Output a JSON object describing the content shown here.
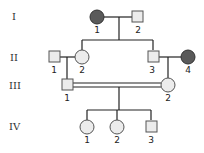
{
  "generations": [
    {
      "label": "I",
      "members": [
        {
          "id": "1",
          "sex": "female",
          "affected": true
        },
        {
          "id": "2",
          "sex": "male",
          "affected": false
        }
      ]
    },
    {
      "label": "II",
      "members": [
        {
          "id": "1",
          "sex": "male",
          "affected": false
        },
        {
          "id": "2",
          "sex": "female",
          "affected": false
        },
        {
          "id": "3",
          "sex": "male",
          "affected": false
        },
        {
          "id": "4",
          "sex": "female",
          "affected": true
        }
      ]
    },
    {
      "label": "III",
      "members": [
        {
          "id": "1",
          "sex": "male",
          "affected": false
        },
        {
          "id": "2",
          "sex": "female",
          "affected": false
        }
      ]
    },
    {
      "label": "IV",
      "members": [
        {
          "id": "1",
          "sex": "female",
          "affected": false
        },
        {
          "id": "2",
          "sex": "female",
          "affected": false
        },
        {
          "id": "3",
          "sex": "male",
          "affected": false
        }
      ]
    }
  ],
  "colors": {
    "affected": "#5a5a5a",
    "unaffected": "#ececec",
    "line": "#222222"
  }
}
